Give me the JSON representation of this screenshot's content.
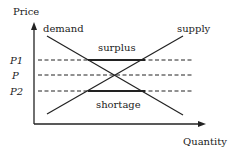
{
  "diagram": {
    "axes": {
      "y_label": "Price",
      "x_label": "Quantity"
    },
    "curves": {
      "demand_label": "demand",
      "supply_label": "supply"
    },
    "price_levels": [
      {
        "label": "P1",
        "note": "above equilibrium"
      },
      {
        "label": "P",
        "note": "equilibrium"
      },
      {
        "label": "P2",
        "note": "below equilibrium"
      }
    ],
    "regions": {
      "surplus_label": "surplus",
      "shortage_label": "shortage"
    },
    "colors": {
      "line": "#222222",
      "background": "#ffffff"
    }
  }
}
